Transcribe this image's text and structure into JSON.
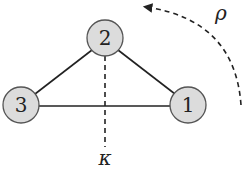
{
  "diagram": {
    "nodes": [
      {
        "id": "1",
        "label": "1",
        "cx": 188,
        "cy": 105
      },
      {
        "id": "2",
        "label": "2",
        "cx": 105,
        "cy": 38
      },
      {
        "id": "3",
        "label": "3",
        "cx": 21,
        "cy": 105
      }
    ],
    "edges": [
      [
        "2",
        "3"
      ],
      [
        "2",
        "1"
      ],
      [
        "3",
        "1"
      ]
    ],
    "node_fill": "#dcdcdc",
    "node_stroke": "#555555",
    "edge_color": "#222222",
    "kappa_label": "κ",
    "rho_label": "ρ"
  }
}
